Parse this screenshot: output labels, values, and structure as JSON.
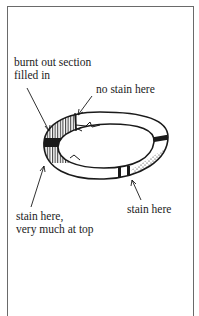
{
  "figure": {
    "title": "",
    "labels": {
      "burnt_out_line1": "burnt out section",
      "burnt_out_line2": "filled in",
      "no_stain": "no stain here",
      "stain_right": "stain here",
      "stain_left_line1": "stain here,",
      "stain_left_line2": "very much at top"
    },
    "colors": {
      "ink": "#1a1a1a",
      "frame": "#6a6a6a",
      "background": "#ffffff"
    }
  }
}
